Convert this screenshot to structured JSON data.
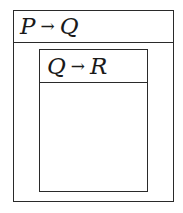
{
  "outer_box": {
    "premise": "P",
    "arrow": "→",
    "conclusion": "Q"
  },
  "inner_box": {
    "premise": "Q",
    "arrow": "→",
    "conclusion": "R"
  },
  "colors": {
    "line": "#2a2a2a",
    "background": "#ffffff"
  }
}
